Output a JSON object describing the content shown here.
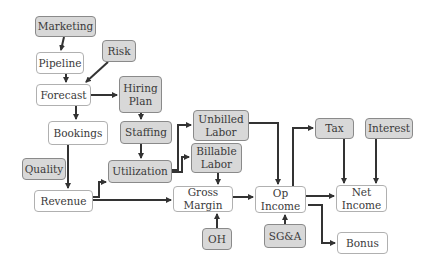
{
  "diagram": {
    "title": "",
    "colors": {
      "input_fill": "#d8d8d8",
      "output_fill": "#ffffff",
      "arrow": "#333333"
    },
    "nodes": [
      {
        "id": "marketing",
        "label": "Marketing",
        "kind": "input",
        "x": 35,
        "y": 16,
        "w": 61,
        "h": 21
      },
      {
        "id": "risk",
        "label": "Risk",
        "kind": "input",
        "x": 102,
        "y": 40,
        "w": 34,
        "h": 22
      },
      {
        "id": "pipeline",
        "label": "Pipeline",
        "kind": "output",
        "x": 36,
        "y": 52,
        "w": 48,
        "h": 22
      },
      {
        "id": "forecast",
        "label": "Forecast",
        "kind": "output",
        "x": 36,
        "y": 84,
        "w": 55,
        "h": 22
      },
      {
        "id": "hiring_plan",
        "label": "Hiring\nPlan",
        "kind": "input",
        "x": 119,
        "y": 76,
        "w": 43,
        "h": 37
      },
      {
        "id": "bookings",
        "label": "Bookings",
        "kind": "output",
        "x": 48,
        "y": 121,
        "w": 60,
        "h": 24
      },
      {
        "id": "staffing",
        "label": "Staffing",
        "kind": "input",
        "x": 120,
        "y": 121,
        "w": 52,
        "h": 23
      },
      {
        "id": "quality",
        "label": "Quality",
        "kind": "input",
        "x": 22,
        "y": 158,
        "w": 44,
        "h": 22
      },
      {
        "id": "utilization",
        "label": "Utilization",
        "kind": "input",
        "x": 108,
        "y": 160,
        "w": 64,
        "h": 23
      },
      {
        "id": "revenue",
        "label": "Revenue",
        "kind": "output",
        "x": 34,
        "y": 190,
        "w": 59,
        "h": 22
      },
      {
        "id": "unbilled_labor",
        "label": "Unbilled\nLabor",
        "kind": "input",
        "x": 193,
        "y": 110,
        "w": 56,
        "h": 31
      },
      {
        "id": "billable_labor",
        "label": "Billable\nLabor",
        "kind": "input",
        "x": 191,
        "y": 143,
        "w": 51,
        "h": 30
      },
      {
        "id": "gross_margin",
        "label": "Gross\nMargin",
        "kind": "output",
        "x": 173,
        "y": 186,
        "w": 60,
        "h": 26
      },
      {
        "id": "oh",
        "label": "OH",
        "kind": "input",
        "x": 202,
        "y": 228,
        "w": 30,
        "h": 22
      },
      {
        "id": "op_income",
        "label": "Op\nIncome",
        "kind": "output",
        "x": 255,
        "y": 186,
        "w": 51,
        "h": 27
      },
      {
        "id": "sga",
        "label": "SG&A",
        "kind": "input",
        "x": 264,
        "y": 224,
        "w": 42,
        "h": 24
      },
      {
        "id": "tax",
        "label": "Tax",
        "kind": "input",
        "x": 315,
        "y": 118,
        "w": 39,
        "h": 21
      },
      {
        "id": "interest",
        "label": "Interest",
        "kind": "input",
        "x": 365,
        "y": 118,
        "w": 48,
        "h": 21
      },
      {
        "id": "net_income",
        "label": "Net\nIncome",
        "kind": "output",
        "x": 336,
        "y": 185,
        "w": 51,
        "h": 27
      },
      {
        "id": "bonus",
        "label": "Bonus",
        "kind": "output",
        "x": 337,
        "y": 232,
        "w": 51,
        "h": 22
      }
    ],
    "edges": [
      {
        "from": "marketing",
        "to": "pipeline",
        "path": "M64,37 L61,50"
      },
      {
        "from": "risk",
        "to": "forecast",
        "path": "M108,62 L86,82"
      },
      {
        "from": "pipeline",
        "to": "forecast",
        "path": "M66,74 L66,82"
      },
      {
        "from": "forecast",
        "to": "hiring_plan",
        "path": "M91,95 L117,95"
      },
      {
        "from": "forecast",
        "to": "bookings",
        "path": "M76,106 L76,119"
      },
      {
        "from": "hiring_plan",
        "to": "staffing",
        "path": "M141,113 L141,119"
      },
      {
        "from": "bookings",
        "to": "revenue",
        "path": "M68,145 L68,188"
      },
      {
        "from": "staffing",
        "to": "utilization",
        "path": "M141,144 L141,158"
      },
      {
        "from": "revenue",
        "to": "utilization",
        "path": "M93,197 L99,197 L99,182 L106,182"
      },
      {
        "from": "revenue",
        "to": "gross_margin",
        "path": "M93,200 L171,200"
      },
      {
        "from": "utilization",
        "to": "unbilled_labor",
        "path": "M172,170 L178,170 L178,125 L191,125"
      },
      {
        "from": "utilization",
        "to": "billable_labor",
        "path": "M172,172 L182,172 L182,157 L189,157"
      },
      {
        "from": "billable_labor",
        "to": "gross_margin",
        "path": "M218,173 L218,184"
      },
      {
        "from": "unbilled_labor",
        "to": "op_income",
        "path": "M249,123 L278,123 L278,184"
      },
      {
        "from": "oh",
        "to": "gross_margin",
        "path": "M217,228 L217,214"
      },
      {
        "from": "gross_margin",
        "to": "op_income",
        "path": "M233,197 L253,197"
      },
      {
        "from": "sga",
        "to": "op_income",
        "path": "M285,224 L285,215"
      },
      {
        "from": "op_income",
        "to": "tax",
        "path": "M293,186 L293,128 L313,128"
      },
      {
        "from": "op_income",
        "to": "net_income",
        "path": "M306,196 L334,196"
      },
      {
        "from": "tax",
        "to": "net_income",
        "path": "M344,139 L344,183"
      },
      {
        "from": "interest",
        "to": "net_income",
        "path": "M376,139 L376,183"
      },
      {
        "from": "op_income",
        "to": "bonus",
        "path": "M308,205 L322,205 L322,243 L335,243"
      }
    ]
  }
}
